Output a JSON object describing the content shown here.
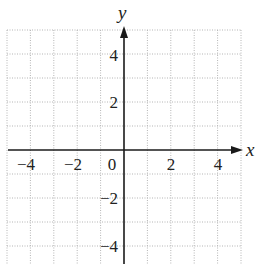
{
  "chart_data": {
    "type": "line",
    "title": "",
    "xlabel": "x",
    "ylabel": "y",
    "xlim": [
      -5,
      5
    ],
    "ylim": [
      -5,
      5
    ],
    "grid": true,
    "grid_style": "dotted",
    "grid_step": 1,
    "x_ticks": [
      -4,
      -2,
      0,
      2,
      4
    ],
    "y_ticks": [
      4,
      2,
      -2,
      -4
    ],
    "x_tick_labels": [
      "−4",
      "−2",
      "0",
      "2",
      "4"
    ],
    "y_tick_labels": [
      "4",
      "2",
      "−2",
      "−4"
    ],
    "series": [],
    "legend": null
  },
  "labels": {
    "x_axis": "x",
    "y_axis": "y",
    "x_ticks": [
      "−4",
      "−2",
      "0",
      "2",
      "4"
    ],
    "y_ticks": [
      "4",
      "2",
      "−2",
      "−4"
    ]
  },
  "colors": {
    "grid": "#b5b5b5",
    "axis": "#1a1a1a",
    "text": "#222222",
    "background": "#ffffff"
  }
}
